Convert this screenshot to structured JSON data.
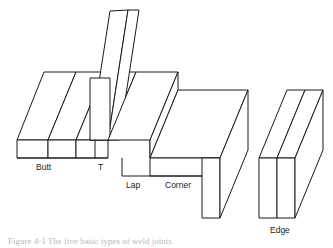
{
  "figure": {
    "caption": "Figure 4-1  The five basic types of weld joints.",
    "line_color": "#1a1a1a",
    "face_color": "#ffffff",
    "background_color": "#ffffff",
    "label_color": "#222222",
    "caption_color": "#b9b9b9",
    "labels": [
      {
        "name": "butt",
        "text": "Butt",
        "x": 36,
        "y": 170
      },
      {
        "name": "t",
        "text": "T",
        "x": 98,
        "y": 170
      },
      {
        "name": "lap",
        "text": "Lap",
        "x": 126,
        "y": 188
      },
      {
        "name": "corner",
        "text": "Corner",
        "x": 165,
        "y": 188
      },
      {
        "name": "edge",
        "text": "Edge",
        "x": 273,
        "y": 233
      }
    ],
    "joints": [
      "Butt",
      "T",
      "Lap",
      "Corner",
      "Edge"
    ]
  }
}
